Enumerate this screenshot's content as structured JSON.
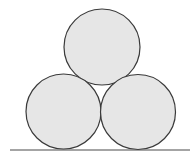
{
  "diagram": {
    "colors": {
      "background": "#ffffff",
      "circle_fill": "#e6e6e6",
      "circle_stroke": "#3a3a3a",
      "ground_stroke": "#4a4a4a"
    },
    "circles": [
      {
        "name": "top",
        "cx": 102,
        "cy": 47,
        "r": 38
      },
      {
        "name": "bottom-left",
        "cx": 63.5,
        "cy": 111.5,
        "r": 37.5
      },
      {
        "name": "bottom-right",
        "cx": 138,
        "cy": 112,
        "r": 37.5
      }
    ],
    "ground_line": {
      "x1": 10,
      "y1": 150,
      "x2": 190,
      "y2": 150
    }
  }
}
